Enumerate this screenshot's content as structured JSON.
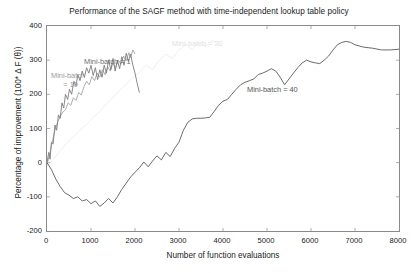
{
  "chart_data": {
    "type": "line",
    "title": "Performance of the SAGF method with time-independent lookup table policy",
    "xlabel": "Number of function evaluations",
    "ylabel": "Percentage of improvement (100* Δ F (θ))",
    "xlim": [
      0,
      8000
    ],
    "ylim": [
      -200,
      400
    ],
    "xticks": [
      0,
      1000,
      2000,
      3000,
      4000,
      5000,
      6000,
      7000,
      8000
    ],
    "yticks": [
      400,
      300,
      200,
      100,
      0,
      -100,
      -200
    ],
    "xtick_labels": [
      "0",
      "1000",
      "2000",
      "3000",
      "4000",
      "5000",
      "6000",
      "7000",
      "8000"
    ],
    "ytick_labels": [
      "400",
      "300",
      "200",
      "100",
      "0",
      "-100",
      "-200"
    ],
    "grid": false,
    "legend_position": "inline-annotations",
    "annotations": [
      {
        "text": "Mini-batch = 1",
        "x_px": 84,
        "y_px": 57,
        "color": "#6e6e6e"
      },
      {
        "text": "Mini-batch\n      = 10",
        "x_px": 51,
        "y_px": 71,
        "color": "#9a9a9a"
      },
      {
        "text": "Mini-batch = 20",
        "x_px": 172,
        "y_px": 39,
        "color": "#e2e2e2"
      },
      {
        "text": "Mini-batch = 40",
        "x_px": 247,
        "y_px": 85,
        "color": "#555555"
      }
    ],
    "series": [
      {
        "name": "Mini-batch = 1",
        "color": "#7d7d7d",
        "points": [
          [
            0,
            0
          ],
          [
            40,
            30
          ],
          [
            70,
            10
          ],
          [
            100,
            60
          ],
          [
            140,
            55
          ],
          [
            180,
            110
          ],
          [
            220,
            95
          ],
          [
            260,
            140
          ],
          [
            300,
            130
          ],
          [
            340,
            175
          ],
          [
            380,
            160
          ],
          [
            420,
            200
          ],
          [
            470,
            185
          ],
          [
            510,
            215
          ],
          [
            560,
            200
          ],
          [
            610,
            238
          ],
          [
            660,
            225
          ],
          [
            700,
            258
          ],
          [
            750,
            240
          ],
          [
            800,
            268
          ],
          [
            850,
            250
          ],
          [
            900,
            278
          ],
          [
            950,
            262
          ],
          [
            1000,
            285
          ],
          [
            1050,
            255
          ],
          [
            1100,
            278
          ],
          [
            1150,
            243
          ],
          [
            1200,
            272
          ],
          [
            1250,
            250
          ],
          [
            1300,
            285
          ],
          [
            1350,
            262
          ],
          [
            1400,
            300
          ],
          [
            1450,
            272
          ],
          [
            1500,
            305
          ],
          [
            1550,
            268
          ],
          [
            1600,
            300
          ],
          [
            1650,
            275
          ],
          [
            1700,
            310
          ],
          [
            1750,
            285
          ],
          [
            1800,
            320
          ],
          [
            1850,
            296
          ],
          [
            1900,
            318
          ],
          [
            1950,
            286
          ],
          [
            2000,
            262
          ],
          [
            2050,
            232
          ],
          [
            2100,
            205
          ]
        ]
      },
      {
        "name": "Mini-batch = 10",
        "color": "#a5a5a5",
        "points": [
          [
            0,
            -5
          ],
          [
            60,
            25
          ],
          [
            120,
            60
          ],
          [
            180,
            95
          ],
          [
            240,
            118
          ],
          [
            300,
            135
          ],
          [
            360,
            148
          ],
          [
            420,
            155
          ],
          [
            480,
            175
          ],
          [
            540,
            168
          ],
          [
            600,
            190
          ],
          [
            660,
            182
          ],
          [
            720,
            205
          ],
          [
            780,
            198
          ],
          [
            840,
            222
          ],
          [
            900,
            238
          ],
          [
            960,
            228
          ],
          [
            1020,
            252
          ],
          [
            1080,
            240
          ],
          [
            1140,
            262
          ],
          [
            1200,
            250
          ],
          [
            1260,
            272
          ],
          [
            1320,
            258
          ],
          [
            1380,
            280
          ],
          [
            1440,
            268
          ],
          [
            1500,
            292
          ],
          [
            1560,
            278
          ],
          [
            1620,
            300
          ],
          [
            1680,
            288
          ],
          [
            1740,
            312
          ],
          [
            1800,
            298
          ],
          [
            1860,
            322
          ],
          [
            1900,
            308
          ],
          [
            1950,
            330
          ],
          [
            2000,
            318
          ]
        ]
      },
      {
        "name": "Mini-batch = 20",
        "color": "#ededed",
        "points": [
          [
            0,
            -10
          ],
          [
            150,
            10
          ],
          [
            300,
            35
          ],
          [
            450,
            58
          ],
          [
            600,
            75
          ],
          [
            750,
            95
          ],
          [
            900,
            112
          ],
          [
            1050,
            132
          ],
          [
            1200,
            150
          ],
          [
            1350,
            172
          ],
          [
            1500,
            190
          ],
          [
            1650,
            212
          ],
          [
            1800,
            228
          ],
          [
            1950,
            250
          ],
          [
            2100,
            265
          ],
          [
            2250,
            285
          ],
          [
            2400,
            272
          ],
          [
            2550,
            300
          ],
          [
            2700,
            318
          ],
          [
            2850,
            305
          ],
          [
            3000,
            330
          ],
          [
            3150,
            345
          ],
          [
            3300,
            332
          ],
          [
            3450,
            352
          ],
          [
            3600,
            340
          ],
          [
            3750,
            358
          ],
          [
            3900,
            345
          ],
          [
            4000,
            338
          ]
        ]
      },
      {
        "name": "Mini-batch = 40",
        "color": "#5a5a5a",
        "points": [
          [
            0,
            0
          ],
          [
            100,
            -20
          ],
          [
            200,
            -48
          ],
          [
            300,
            -70
          ],
          [
            400,
            -88
          ],
          [
            500,
            -95
          ],
          [
            600,
            -105
          ],
          [
            700,
            -100
          ],
          [
            800,
            -112
          ],
          [
            900,
            -108
          ],
          [
            1000,
            -120
          ],
          [
            1100,
            -112
          ],
          [
            1200,
            -128
          ],
          [
            1300,
            -118
          ],
          [
            1400,
            -105
          ],
          [
            1500,
            -118
          ],
          [
            1600,
            -100
          ],
          [
            1700,
            -78
          ],
          [
            1800,
            -60
          ],
          [
            1900,
            -42
          ],
          [
            2000,
            -28
          ],
          [
            2100,
            -15
          ],
          [
            2200,
            2
          ],
          [
            2300,
            -12
          ],
          [
            2400,
            5
          ],
          [
            2500,
            20
          ],
          [
            2600,
            8
          ],
          [
            2700,
            30
          ],
          [
            2800,
            18
          ],
          [
            2900,
            42
          ],
          [
            3000,
            60
          ],
          [
            3100,
            95
          ],
          [
            3200,
            118
          ],
          [
            3300,
            128
          ],
          [
            3400,
            130
          ],
          [
            3500,
            130
          ],
          [
            3600,
            131
          ],
          [
            3700,
            133
          ],
          [
            3800,
            150
          ],
          [
            3900,
            168
          ],
          [
            4000,
            180
          ],
          [
            4100,
            185
          ],
          [
            4200,
            200
          ],
          [
            4300,
            215
          ],
          [
            4400,
            228
          ],
          [
            4500,
            235
          ],
          [
            4600,
            240
          ],
          [
            4700,
            245
          ],
          [
            4800,
            258
          ],
          [
            4900,
            262
          ],
          [
            5000,
            268
          ],
          [
            5100,
            275
          ],
          [
            5200,
            268
          ],
          [
            5300,
            250
          ],
          [
            5400,
            228
          ],
          [
            5500,
            245
          ],
          [
            5600,
            262
          ],
          [
            5700,
            278
          ],
          [
            5800,
            292
          ],
          [
            5900,
            300
          ],
          [
            6000,
            295
          ],
          [
            6100,
            292
          ],
          [
            6200,
            290
          ],
          [
            6300,
            300
          ],
          [
            6400,
            312
          ],
          [
            6500,
            330
          ],
          [
            6600,
            345
          ],
          [
            6700,
            352
          ],
          [
            6800,
            355
          ],
          [
            6900,
            352
          ],
          [
            7000,
            345
          ],
          [
            7200,
            338
          ],
          [
            7400,
            335
          ],
          [
            7600,
            330
          ],
          [
            7800,
            330
          ],
          [
            8000,
            332
          ]
        ]
      }
    ]
  }
}
